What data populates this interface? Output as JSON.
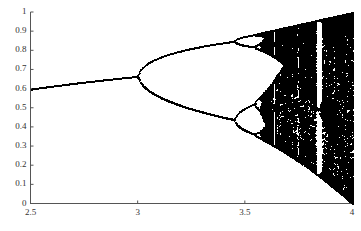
{
  "chart_data": {
    "type": "scatter",
    "title": "",
    "subtitle": "",
    "xlabel": "",
    "ylabel": "",
    "xlim": [
      2.5,
      4.0
    ],
    "ylim": [
      0,
      1
    ],
    "grid": false,
    "legend": null,
    "x_ticks": [
      {
        "value": 2.5,
        "label": "2.5"
      },
      {
        "value": 3.0,
        "label": "3"
      },
      {
        "value": 3.5,
        "label": "3.5"
      },
      {
        "value": 4.0,
        "label": "4"
      }
    ],
    "y_ticks": [
      {
        "value": 0,
        "label": "0"
      },
      {
        "value": 0.1,
        "label": "0.1"
      },
      {
        "value": 0.2,
        "label": "0.2"
      },
      {
        "value": 0.3,
        "label": "0.3"
      },
      {
        "value": 0.4,
        "label": "0.4"
      },
      {
        "value": 0.5,
        "label": "0.5"
      },
      {
        "value": 0.6,
        "label": "0.6"
      },
      {
        "value": 0.7,
        "label": "0.7"
      },
      {
        "value": 0.8,
        "label": "0.8"
      },
      {
        "value": 0.9,
        "label": "0.9"
      },
      {
        "value": 1,
        "label": "1"
      }
    ],
    "series": [
      {
        "name": "logistic-map-attractor",
        "color": "#000000",
        "point_size": 1.1,
        "generator": {
          "map": "logistic",
          "formula": "x_{n+1} = r * x_n * (1 - x_n)",
          "r_min": 2.5,
          "r_max": 4.0,
          "r_steps": 520,
          "x0": 0.3,
          "transient_iterations": 260,
          "plot_iterations": 170
        }
      }
    ],
    "annotations": [
      {
        "label": "period-1 fixed point",
        "r_range": [
          2.5,
          3.0
        ],
        "x_value_at_r_2_5": 0.6
      },
      {
        "label": "first period-doubling",
        "r": 3.0,
        "x_value": 0.667
      },
      {
        "label": "second period-doubling",
        "r": 3.449,
        "x_values": [
          0.85,
          0.44
        ]
      },
      {
        "label": "onset of chaos",
        "r": 3.5699
      },
      {
        "label": "period-3 window",
        "r_range": [
          3.828,
          3.857
        ]
      }
    ]
  },
  "axes": {
    "x_axis_color": "#555555",
    "y_axis_color": "#555555",
    "tick_color": "#555555",
    "background": "#ffffff",
    "data_color": "#000000"
  }
}
